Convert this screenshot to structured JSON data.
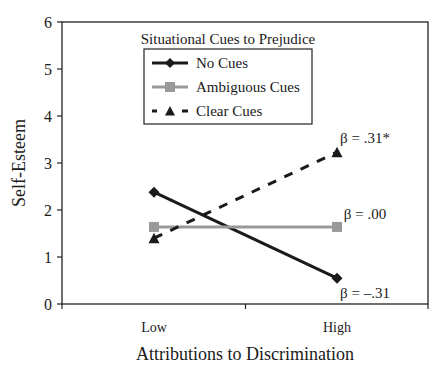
{
  "chart_data": {
    "type": "line",
    "title": "",
    "xlabel": "Attributions to Discrimination",
    "ylabel": "Self-Esteem",
    "categories": [
      "Low",
      "High"
    ],
    "ylim": [
      0,
      6
    ],
    "yticks": [
      0,
      1,
      2,
      3,
      4,
      5,
      6
    ],
    "grid": false,
    "legend": {
      "title": "Situational Cues to Prejudice",
      "position": "upper center",
      "entries": [
        "No Cues",
        "Ambiguous Cues",
        "Clear Cues"
      ]
    },
    "series": [
      {
        "name": "No Cues",
        "values": [
          2.38,
          0.55
        ],
        "color": "#1a1a1a",
        "line_style": "solid",
        "marker": "diamond",
        "annotation": "β = –.31"
      },
      {
        "name": "Ambiguous Cues",
        "values": [
          1.64,
          1.64
        ],
        "color": "#999999",
        "line_style": "solid",
        "marker": "square",
        "annotation": "β = .00"
      },
      {
        "name": "Clear Cues",
        "values": [
          1.4,
          3.23
        ],
        "color": "#1a1a1a",
        "line_style": "dashed",
        "marker": "triangle",
        "annotation": "β = .31*"
      }
    ]
  }
}
